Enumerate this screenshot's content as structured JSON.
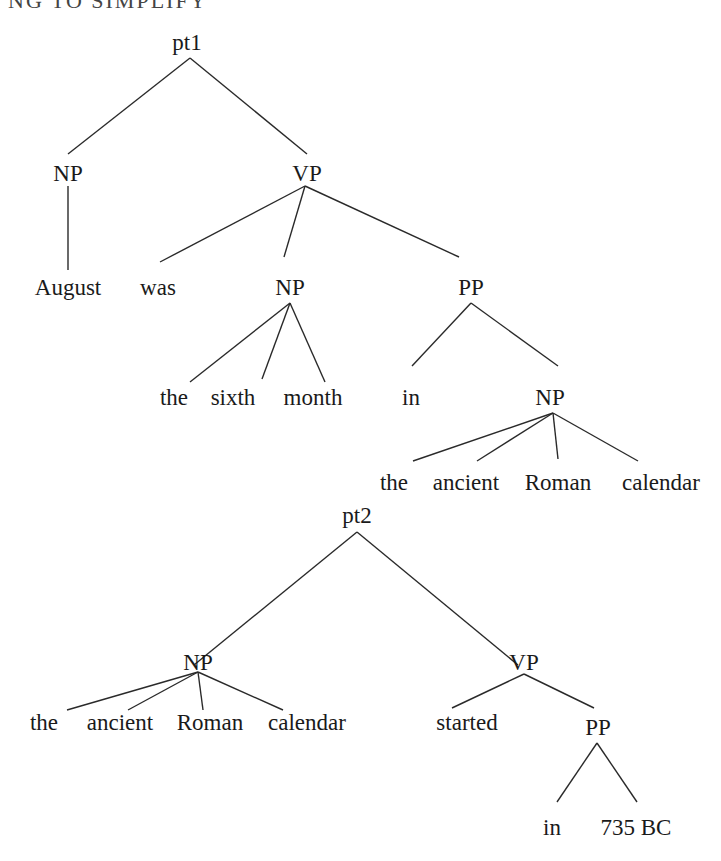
{
  "heading": "NG TO SIMPLIFY",
  "trees": [
    {
      "id": "pt1",
      "nodes": [
        {
          "id": "t1_root",
          "label": "pt1",
          "x": 187,
          "y": 50
        },
        {
          "id": "t1_np",
          "label": "NP",
          "x": 68,
          "y": 181
        },
        {
          "id": "t1_vp",
          "label": "VP",
          "x": 307,
          "y": 181
        },
        {
          "id": "t1_august",
          "label": "August",
          "x": 68,
          "y": 295
        },
        {
          "id": "t1_was",
          "label": "was",
          "x": 158,
          "y": 295
        },
        {
          "id": "t1_np2",
          "label": "NP",
          "x": 290,
          "y": 295
        },
        {
          "id": "t1_pp",
          "label": "PP",
          "x": 471,
          "y": 295
        },
        {
          "id": "t1_the",
          "label": "the",
          "x": 174,
          "y": 405
        },
        {
          "id": "t1_sixth",
          "label": "sixth",
          "x": 233,
          "y": 405
        },
        {
          "id": "t1_month",
          "label": "month",
          "x": 313,
          "y": 405
        },
        {
          "id": "t1_in",
          "label": "in",
          "x": 411,
          "y": 405
        },
        {
          "id": "t1_np3",
          "label": "NP",
          "x": 550,
          "y": 405
        },
        {
          "id": "t1_the2",
          "label": "the",
          "x": 394,
          "y": 490
        },
        {
          "id": "t1_ancient",
          "label": "ancient",
          "x": 466,
          "y": 490
        },
        {
          "id": "t1_roman",
          "label": "Roman",
          "x": 558,
          "y": 490
        },
        {
          "id": "t1_calendar",
          "label": "calendar",
          "x": 661,
          "y": 490
        }
      ],
      "edges": [
        {
          "from": [
            190,
            58
          ],
          "to": [
            68,
            154
          ]
        },
        {
          "from": [
            190,
            58
          ],
          "to": [
            307,
            154
          ]
        },
        {
          "from": [
            68,
            186
          ],
          "to": [
            68,
            270
          ]
        },
        {
          "from": [
            305,
            186
          ],
          "to": [
            160,
            262
          ]
        },
        {
          "from": [
            305,
            186
          ],
          "to": [
            284,
            257
          ]
        },
        {
          "from": [
            305,
            186
          ],
          "to": [
            459,
            257
          ]
        },
        {
          "from": [
            290,
            303
          ],
          "to": [
            190,
            382
          ]
        },
        {
          "from": [
            290,
            303
          ],
          "to": [
            262,
            379
          ]
        },
        {
          "from": [
            290,
            303
          ],
          "to": [
            325,
            382
          ]
        },
        {
          "from": [
            471,
            303
          ],
          "to": [
            412,
            366
          ]
        },
        {
          "from": [
            471,
            303
          ],
          "to": [
            558,
            366
          ]
        },
        {
          "from": [
            553,
            413
          ],
          "to": [
            413,
            461
          ]
        },
        {
          "from": [
            553,
            413
          ],
          "to": [
            477,
            461
          ]
        },
        {
          "from": [
            553,
            413
          ],
          "to": [
            558,
            459
          ]
        },
        {
          "from": [
            553,
            413
          ],
          "to": [
            638,
            461
          ]
        }
      ]
    },
    {
      "id": "pt2",
      "nodes": [
        {
          "id": "t2_root",
          "label": "pt2",
          "x": 357,
          "y": 523
        },
        {
          "id": "t2_np",
          "label": "NP",
          "x": 198,
          "y": 670
        },
        {
          "id": "t2_vp",
          "label": "VP",
          "x": 524,
          "y": 670
        },
        {
          "id": "t2_the",
          "label": "the",
          "x": 44,
          "y": 730
        },
        {
          "id": "t2_ancient",
          "label": "ancient",
          "x": 120,
          "y": 730
        },
        {
          "id": "t2_roman",
          "label": "Roman",
          "x": 210,
          "y": 730
        },
        {
          "id": "t2_calendar",
          "label": "calendar",
          "x": 307,
          "y": 730
        },
        {
          "id": "t2_started",
          "label": "started",
          "x": 467,
          "y": 730
        },
        {
          "id": "t2_pp",
          "label": "PP",
          "x": 598,
          "y": 735
        },
        {
          "id": "t2_in",
          "label": "in",
          "x": 552,
          "y": 835
        },
        {
          "id": "t2_735bc",
          "label": "735 BC",
          "x": 636,
          "y": 835
        }
      ],
      "edges": [
        {
          "from": [
            357,
            532
          ],
          "to": [
            194,
            665
          ]
        },
        {
          "from": [
            357,
            532
          ],
          "to": [
            518,
            665
          ]
        },
        {
          "from": [
            198,
            672
          ],
          "to": [
            67,
            710
          ]
        },
        {
          "from": [
            198,
            672
          ],
          "to": [
            128,
            710
          ]
        },
        {
          "from": [
            198,
            672
          ],
          "to": [
            203,
            710
          ]
        },
        {
          "from": [
            198,
            672
          ],
          "to": [
            283,
            710
          ]
        },
        {
          "from": [
            524,
            674
          ],
          "to": [
            452,
            708
          ]
        },
        {
          "from": [
            524,
            674
          ],
          "to": [
            594,
            708
          ]
        },
        {
          "from": [
            597,
            743
          ],
          "to": [
            557,
            802
          ]
        },
        {
          "from": [
            597,
            743
          ],
          "to": [
            637,
            802
          ]
        }
      ]
    }
  ]
}
